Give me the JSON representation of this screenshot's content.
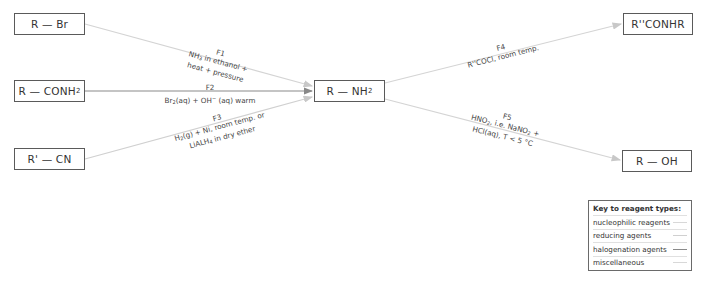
{
  "compounds": {
    "bromoalkane": "R — Br",
    "amide_left_main": "R — CONH",
    "amide_left_sub": "2",
    "nitrile": "R' — CN",
    "amine_main": "R — NH",
    "amine_sub": "2",
    "substituted_amide": "R''CONHR",
    "alcohol": "R — OH"
  },
  "reactions": {
    "F1": {
      "id": "F1",
      "line1_pre": "NH",
      "line1_sub": "3",
      "line1_post": " in ethanol +",
      "line2": "heat + pressure",
      "type": "nucleophilic"
    },
    "F2": {
      "id": "F2",
      "line1_a": "Br",
      "line1_a_sub": "2",
      "line1_b": "(aq) + OH",
      "line1_c_sup": "−",
      "line1_d": " (aq) warm",
      "type": "halogenation"
    },
    "F3": {
      "id": "F3",
      "line1_a": "H",
      "line1_a_sub": "2",
      "line1_b": "(g) + Ni, room temp. or",
      "line2_a": "LiALH",
      "line2_a_sub": "4",
      "line2_b": " in dry ether",
      "type": "reducing"
    },
    "F4": {
      "id": "F4",
      "line1": "R''COCl, room temp.",
      "type": "nucleophilic"
    },
    "F5": {
      "id": "F5",
      "line1_a": "HNO",
      "line1_a_sub": "2",
      "line1_b": ", i.e. NaNO",
      "line1_c_sub": "2",
      "line1_d": " +",
      "line2": "HCl(aq), T < 5 °C",
      "type": "miscellaneous"
    }
  },
  "key": {
    "title": "Key to reagent types:",
    "items": [
      {
        "label": "nucleophilic reagents",
        "color": "#d8d8d8"
      },
      {
        "label": "reducing agents",
        "color": "#d0d0d0"
      },
      {
        "label": "halogenation agents",
        "color": "#8a8a8a"
      },
      {
        "label": "miscellaneous",
        "color": "#d8d8d8"
      }
    ]
  },
  "colors": {
    "box_border": "#5a5a5a",
    "line_light": "#d4d4d4",
    "line_dark": "#8a8a8a"
  }
}
